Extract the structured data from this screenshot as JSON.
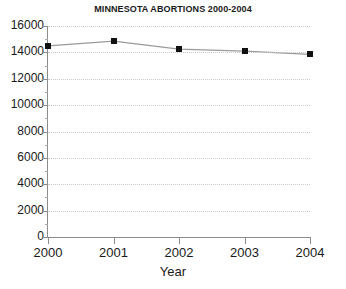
{
  "chart_data": {
    "type": "line",
    "title": "MINNESOTA ABORTIONS 2000-2004",
    "xlabel": "Year",
    "ylabel": "",
    "categories": [
      "2000",
      "2001",
      "2002",
      "2003",
      "2004"
    ],
    "x": [
      2000,
      2001,
      2002,
      2003,
      2004
    ],
    "values": [
      14500,
      14850,
      14250,
      14100,
      13850
    ],
    "series": [
      {
        "name": "Abortions",
        "values": [
          14500,
          14850,
          14250,
          14100,
          13850
        ]
      }
    ],
    "xlim": [
      2000,
      2004
    ],
    "ylim": [
      0,
      16000
    ],
    "ytick_labels": [
      "0",
      "2000",
      "4000",
      "6000",
      "8000",
      "10000",
      "12000",
      "14000",
      "16000"
    ],
    "ytick_values": [
      0,
      2000,
      4000,
      6000,
      8000,
      10000,
      12000,
      14000,
      16000
    ],
    "ytick_minor_values": [
      1000,
      3000,
      5000,
      7000,
      9000,
      11000,
      13000,
      15000
    ],
    "xtick_labels": [
      "2000",
      "2001",
      "2002",
      "2003",
      "2004"
    ],
    "grid": "horizontal-dotted",
    "legend": "none",
    "marker": "square",
    "colors": {
      "line": "#9a9a9a",
      "marker": "#111111",
      "axis": "#8c8c8c",
      "grid": "#c9c9c9",
      "text": "#1a1a1a",
      "background": "#ffffff"
    }
  }
}
